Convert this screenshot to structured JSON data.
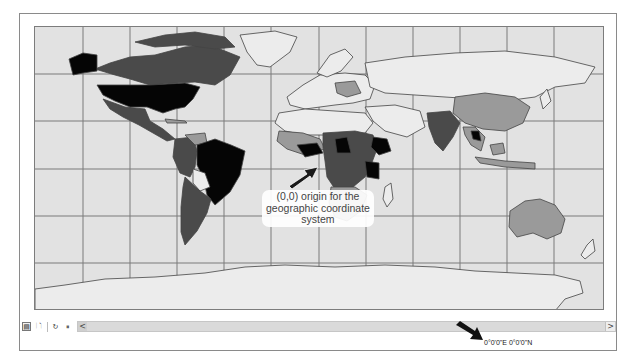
{
  "map": {
    "projection": "geographic (plate carree)",
    "graticule_spacing_deg": 30,
    "fill_colors": {
      "ocean": "#e2e2e2",
      "land_light": "#ececec",
      "land_mid": "#9a9a9a",
      "land_dark": "#4a4a4a",
      "land_black": "#050505",
      "border": "#444444"
    }
  },
  "annotation": {
    "label": "(0,0) origin for the geographic coordinate system",
    "line1": "(0,0) origin for the",
    "line2": "geographic coordinate",
    "line3": "system"
  },
  "toolbar": {
    "buttons": [
      {
        "name": "data-view-icon",
        "glyph": "▤"
      },
      {
        "name": "layout-view-icon",
        "glyph": "🗋"
      },
      {
        "name": "refresh-icon",
        "glyph": "↻"
      },
      {
        "name": "pause-icon",
        "glyph": "⏸"
      }
    ],
    "scroll_left": "<",
    "scroll_right": ">"
  },
  "status": {
    "coordinates": "0°0'0\"E  0°0'0\"N"
  }
}
